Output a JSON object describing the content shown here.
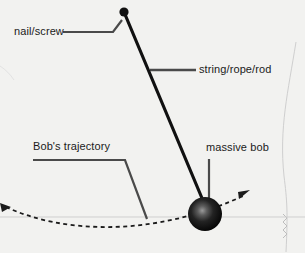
{
  "figure": {
    "background_color": "#f2f2f0",
    "ink_color": "#111111",
    "label_color": "#1b1b1b",
    "leader_color": "#4a4a4a",
    "faint_line_color": "#c9c9c9",
    "width": 305,
    "height": 253
  },
  "labels": {
    "nail_screw": "nail/screw",
    "string_rope_rod": "string/rope/rod",
    "massive_bob": "massive bob",
    "bob_trajectory": "Bob's trajectory"
  },
  "diagram": {
    "pivot": {
      "x": 124,
      "y": 12,
      "radius": 4.5,
      "color": "#111111"
    },
    "bob": {
      "x": 205,
      "y": 214,
      "radius": 17,
      "color": "#0d0d0d",
      "highlight_color": "#8f8f8f"
    },
    "string": {
      "x1": 124,
      "y1": 12,
      "x2": 204,
      "y2": 202,
      "width": 3,
      "color": "#111111"
    },
    "trajectory": {
      "style": "dashed",
      "color": "#1b1b1b",
      "arrowheads": [
        "left",
        "right"
      ],
      "path": "M 4 206 C 60 232, 150 238, 246 196"
    },
    "ground_line": {
      "y": 217,
      "color": "#c9c9c9"
    }
  }
}
